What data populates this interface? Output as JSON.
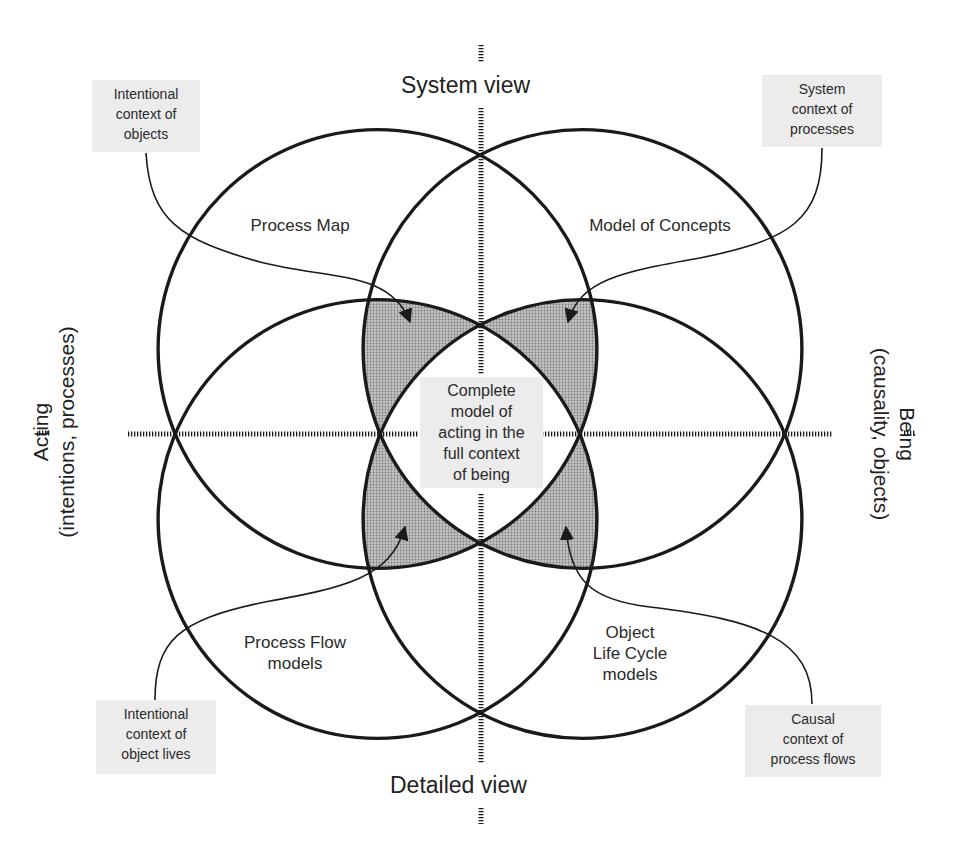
{
  "axes": {
    "top": "System view",
    "bottom": "Detailed view",
    "left": {
      "title": "Acting",
      "subtitle": "(intentions, processes)"
    },
    "right": {
      "title": "Being",
      "subtitle": "(causality, objects)"
    }
  },
  "regions": {
    "top_left": "Process Map",
    "top_right": "Model of Concepts",
    "bottom_left_line1": "Process Flow",
    "bottom_left_line2": "models",
    "bottom_right_line1": "Object",
    "bottom_right_line2": "Life Cycle",
    "bottom_right_line3": "models",
    "center": [
      "Complete",
      "model of",
      "acting in the",
      "full context",
      "of being"
    ]
  },
  "callouts": {
    "top_left": [
      "Intentional",
      "context of",
      "objects"
    ],
    "top_right": [
      "System",
      "context of",
      "processes"
    ],
    "bottom_left": [
      "Intentional",
      "context of",
      "object lives"
    ],
    "bottom_right": [
      "Causal",
      "context of",
      "process flows"
    ]
  },
  "colors": {
    "line": "#1a1a1a",
    "shaded": "#a8a8a8",
    "callout_bg": "#ececec"
  }
}
